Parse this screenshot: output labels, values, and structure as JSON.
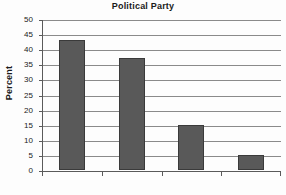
{
  "chart_data": {
    "type": "bar",
    "title": "Political Party",
    "xlabel": "",
    "ylabel": "Percent",
    "categories": [
      "Democrat",
      "Republican",
      "Libertarian",
      "Socialist"
    ],
    "values": [
      43,
      37,
      15,
      5
    ],
    "ylim": [
      0,
      50
    ],
    "ytick_labels": [
      "50",
      "45",
      "40",
      "35",
      "30",
      "25",
      "20",
      "15",
      "10",
      "5",
      "0"
    ],
    "ytick_values": [
      50,
      45,
      40,
      35,
      30,
      25,
      20,
      15,
      10,
      5,
      0
    ],
    "grid": true,
    "legend": false,
    "series": [
      {
        "name": "Percent",
        "values": [
          43,
          37,
          15,
          5
        ],
        "color": "#595959"
      }
    ],
    "colors": {
      "bar_fill": "#595959",
      "bar_border": "#3a3a3a",
      "gridline": "#8a8a8a",
      "axis": "#5a5a5a",
      "text": "#1a1a1a",
      "background": "#fdfdfd"
    }
  }
}
